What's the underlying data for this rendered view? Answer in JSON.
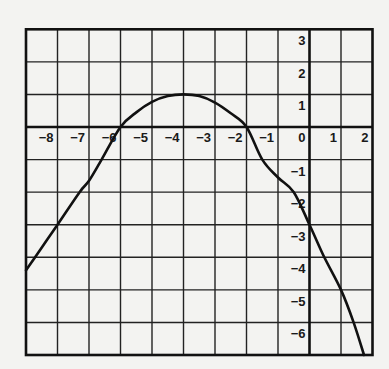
{
  "chart_data": {
    "type": "line",
    "title": "",
    "xlabel": "",
    "ylabel": "",
    "xlim": [
      -9,
      2
    ],
    "ylim": [
      -7,
      3
    ],
    "grid": true,
    "legend": null,
    "x_tick_labels": [
      "−8",
      "−7",
      "−6",
      "−5",
      "−4",
      "−3",
      "−2",
      "−1",
      "0",
      "1",
      "2"
    ],
    "x_tick_values": [
      -8,
      -7,
      -6,
      -5,
      -4,
      -3,
      -2,
      -1,
      0,
      1,
      2
    ],
    "y_tick_labels": [
      "3",
      "2",
      "1",
      "−1",
      "−2",
      "−3",
      "−4",
      "−5",
      "−6"
    ],
    "y_tick_values": [
      3,
      2,
      1,
      -1,
      -2,
      -3,
      -4,
      -5,
      -6
    ],
    "series": [
      {
        "name": "f(x)",
        "x": [
          -9,
          -8.5,
          -8,
          -7.3,
          -7,
          -6.6,
          -6,
          -5.5,
          -5,
          -4.5,
          -4,
          -3.5,
          -3,
          -2.5,
          -2,
          -1.5,
          -1,
          -0.5,
          0,
          0.47,
          1,
          1.4,
          1.73
        ],
        "y": [
          -4.4,
          -3.7,
          -3,
          -2,
          -1.65,
          -1,
          0,
          0.45,
          0.77,
          0.95,
          1.0,
          0.95,
          0.75,
          0.42,
          0,
          -1,
          -1.55,
          -2,
          -3,
          -4,
          -5,
          -6,
          -7
        ]
      }
    ],
    "annotations": {
      "x_intercepts": [
        -6,
        -2
      ],
      "y_intercept": -3,
      "maximum": {
        "x": -4,
        "y": 1
      }
    }
  },
  "style": {
    "line_color": "#111111",
    "grid_color": "#222222",
    "background": "#f3f3f1"
  }
}
